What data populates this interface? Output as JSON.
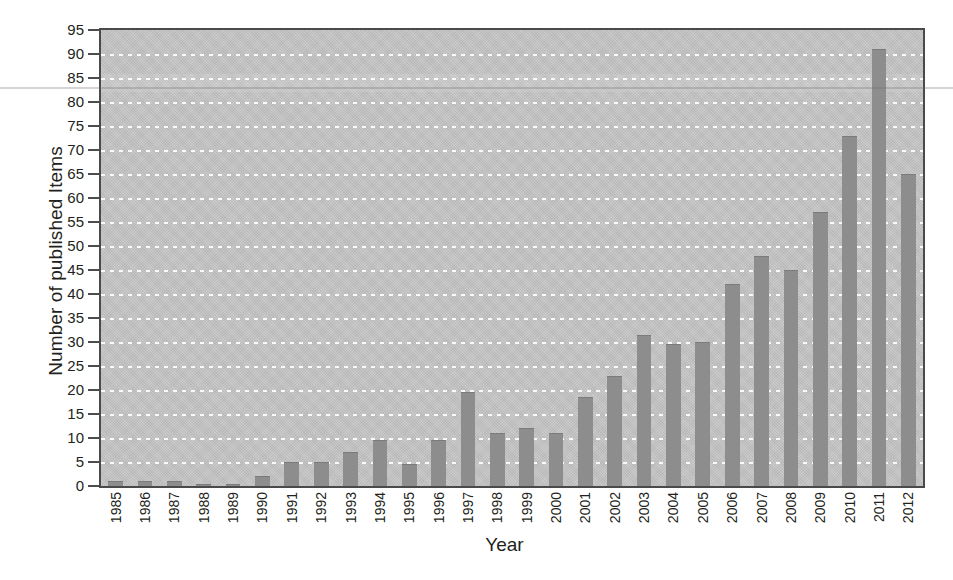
{
  "chart_data": {
    "type": "bar",
    "title": "",
    "xlabel": "Year",
    "ylabel": "Number of published Items",
    "categories": [
      "1985",
      "1986",
      "1987",
      "1988",
      "1989",
      "1990",
      "1991",
      "1992",
      "1993",
      "1994",
      "1995",
      "1996",
      "1997",
      "1998",
      "1999",
      "2000",
      "2001",
      "2002",
      "2003",
      "2004",
      "2005",
      "2006",
      "2007",
      "2008",
      "2009",
      "2010",
      "2011",
      "2012"
    ],
    "values": [
      1,
      1,
      1,
      0.5,
      0.5,
      2,
      5,
      5,
      7,
      9.5,
      4.5,
      9.5,
      19.5,
      11,
      12,
      11,
      18.5,
      23,
      31.5,
      29.5,
      30,
      42,
      48,
      45,
      57,
      73,
      91,
      65
    ],
    "ylim": [
      0,
      95
    ],
    "ytick_step": 5,
    "ytick_labels": [
      "0",
      "5",
      "10",
      "15",
      "20",
      "25",
      "30",
      "35",
      "40",
      "45",
      "50",
      "55",
      "60",
      "65",
      "70",
      "75",
      "80",
      "85",
      "90",
      "95"
    ],
    "grid": true,
    "legend": "none",
    "bar_color": "#8d8d8d",
    "plot_background_color": "#c6c6c6",
    "gridline_color": "#ffffff",
    "axis_color": "#4a4a4a",
    "text_color": "#231f20"
  }
}
